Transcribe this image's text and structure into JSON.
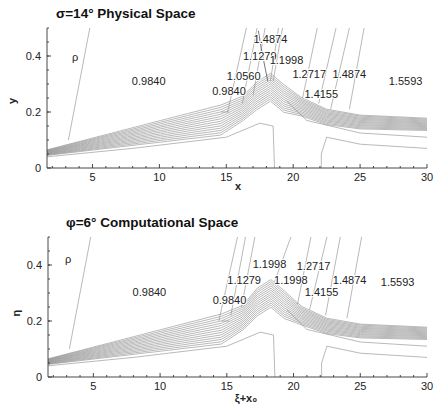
{
  "chart_data": [
    {
      "type": "contour",
      "title": "σ=14° Physical Space",
      "xlabel": "x",
      "ylabel": "y",
      "field_label": "ρ",
      "xlim": [
        1.6,
        30
      ],
      "ylim": [
        0,
        0.5
      ],
      "xticks": [
        "5",
        "10",
        "15",
        "20",
        "25",
        "30"
      ],
      "xtick_values": [
        5,
        10,
        15,
        20,
        25,
        30
      ],
      "yticks": [
        "0",
        "0.2",
        "0.4"
      ],
      "ytick_values": [
        0,
        0.2,
        0.4
      ],
      "contour_labels": [
        {
          "text": "1.4874",
          "x": 18.3,
          "y": 0.46
        },
        {
          "text": "1.1279",
          "x": 17.5,
          "y": 0.4
        },
        {
          "text": "1.1998",
          "x": 19.5,
          "y": 0.385
        },
        {
          "text": "1.0560",
          "x": 16.3,
          "y": 0.33
        },
        {
          "text": "1.2717",
          "x": 21.2,
          "y": 0.335
        },
        {
          "text": "1.4874",
          "x": 24.2,
          "y": 0.335
        },
        {
          "text": "0.9840",
          "x": 9.2,
          "y": 0.31
        },
        {
          "text": "1.5593",
          "x": 28.4,
          "y": 0.31
        },
        {
          "text": "0.9840",
          "x": 15.2,
          "y": 0.275
        },
        {
          "text": "1.4155",
          "x": 22.1,
          "y": 0.265
        }
      ],
      "peak": {
        "x": 18.3,
        "y": 0.32
      },
      "grid": false
    },
    {
      "type": "contour",
      "title": "φ=6°  Computational Space",
      "xlabel": "ξ+x₀",
      "ylabel": "η",
      "field_label": "ρ",
      "xlim": [
        1.6,
        30
      ],
      "ylim": [
        0,
        0.5
      ],
      "xticks": [
        "5",
        "10",
        "15",
        "20",
        "25",
        "30"
      ],
      "xtick_values": [
        5,
        10,
        15,
        20,
        25,
        30
      ],
      "yticks": [
        "0",
        "0.2",
        "0.4"
      ],
      "ytick_values": [
        0,
        0.2,
        0.4
      ],
      "contour_labels": [
        {
          "text": "1.1998",
          "x": 18.2,
          "y": 0.405
        },
        {
          "text": "1.2717",
          "x": 21.5,
          "y": 0.395
        },
        {
          "text": "1.1279",
          "x": 16.3,
          "y": 0.345
        },
        {
          "text": "1.1998",
          "x": 19.8,
          "y": 0.345
        },
        {
          "text": "1.4874",
          "x": 24.2,
          "y": 0.345
        },
        {
          "text": "1.5593",
          "x": 27.8,
          "y": 0.34
        },
        {
          "text": "0.9840",
          "x": 9.2,
          "y": 0.305
        },
        {
          "text": "1.4155",
          "x": 22.1,
          "y": 0.305
        },
        {
          "text": "0.9840",
          "x": 15.2,
          "y": 0.275
        }
      ],
      "peak": {
        "x": 18.3,
        "y": 0.33
      },
      "grid": false
    }
  ]
}
